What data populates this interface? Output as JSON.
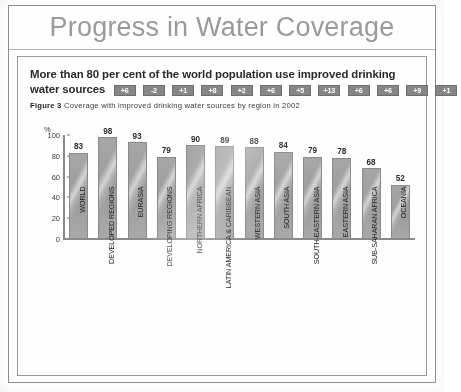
{
  "banner": {
    "title": "Progress in Water Coverage"
  },
  "document": {
    "headline": "More than 80 per cent of the world population use improved drinking water sources",
    "figure_label": "Figure 3",
    "figure_caption": "Coverage with improved drinking water sources by region in 2002"
  },
  "chart_data": {
    "type": "bar",
    "title": "Coverage with improved drinking water sources by region in 2002",
    "xlabel": "",
    "ylabel": "%",
    "ylim": [
      0,
      100
    ],
    "yticks": [
      "0",
      "20",
      "40",
      "60",
      "80",
      "100"
    ],
    "grid": false,
    "legend": "none",
    "categories": [
      "WORLD",
      "DEVELOPED REGIONS",
      "EURASIA",
      "DEVELOPING REGIONS",
      "NORTHERN AFRICA",
      "LATIN AMERICA & CARIBBEAN",
      "WESTERN ASIA",
      "SOUTH ASIA",
      "SOUTH-EASTERN ASIA",
      "EASTERN ASIA",
      "SUB-SAHARAN AFRICA",
      "OCEANIA"
    ],
    "values": [
      83,
      98,
      93,
      79,
      90,
      89,
      88,
      84,
      79,
      78,
      68,
      52
    ],
    "change_badges": [
      "+6",
      "-2",
      "+1",
      "+8",
      "+2",
      "+6",
      "+5",
      "+13",
      "+6",
      "+6",
      "+9",
      "+1"
    ],
    "colors": {
      "bar": "#a2a2a2",
      "badge": "#878787",
      "axis": "#8b8b8b",
      "banner_title": "#9a9a9a"
    }
  }
}
